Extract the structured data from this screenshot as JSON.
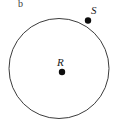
{
  "figure": {
    "id_label": "b",
    "background_color": "#ffffff",
    "stroke_color": "#3c3c3c",
    "point_color": "#0d0d0d",
    "label_color": "#1a1a1a",
    "width": 119,
    "height": 130
  },
  "circle": {
    "name": "circle-outline",
    "center_x": 59,
    "center_y": 68.5,
    "radius": 50,
    "stroke_width": 1,
    "fill": "none"
  },
  "points": [
    {
      "name": "center-point",
      "label": "R",
      "role": "center",
      "x": 62,
      "y": 72,
      "radius": 3.2
    },
    {
      "name": "circumference-point",
      "label": "S",
      "role": "on-circle",
      "x": 88,
      "y": 20.5,
      "radius": 3.2
    }
  ],
  "labels": {
    "figure_id": "b",
    "center": "R",
    "point_s": "S"
  }
}
